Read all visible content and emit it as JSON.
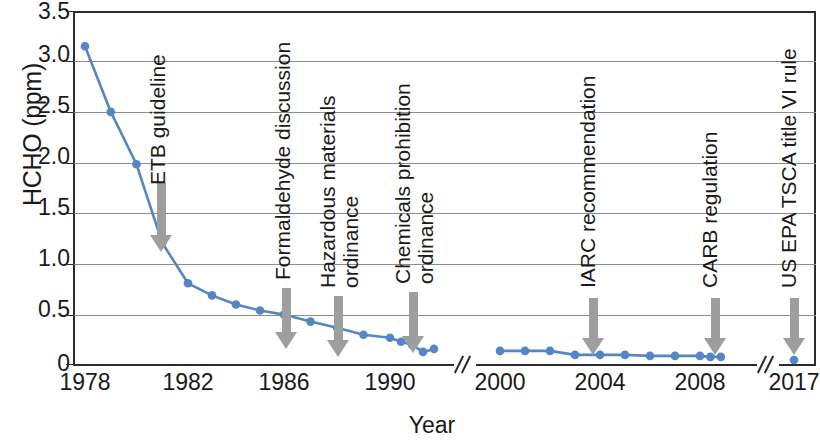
{
  "chart_data": {
    "type": "line",
    "title": "",
    "xlabel": "Year",
    "ylabel": "HCHO (ppm)",
    "ylim": [
      0,
      3.5
    ],
    "yticks": [
      "0",
      "0.5",
      "1.0",
      "1.5",
      "2.0",
      "2.5",
      "3.0",
      "3.5"
    ],
    "ytick_values": [
      0,
      0.5,
      1.0,
      1.5,
      2.0,
      2.5,
      3.0,
      3.5
    ],
    "xticks": [
      "1978",
      "1982",
      "1986",
      "1990",
      "2000",
      "2004",
      "2008",
      "2017"
    ],
    "grid": "horizontal",
    "legend": "none",
    "axis_breaks": [
      "between 1995 and 2000",
      "between 2010 and 2017"
    ],
    "line_color": "#5585c4",
    "marker_color": "#5585c4",
    "series": [
      {
        "name": "HCHO concentration",
        "x": [
          1978,
          1979,
          1980,
          1981,
          1982,
          1983,
          1984,
          1985,
          1986,
          1987,
          1988,
          1989,
          1990,
          1991,
          1992,
          1993,
          1994,
          1995
        ],
        "values": [
          3.15,
          2.5,
          1.98,
          1.2,
          0.8,
          0.68,
          0.59,
          0.53,
          0.49,
          0.42,
          0.36,
          0.29,
          0.26,
          0.22,
          0.19,
          0.12,
          0.15,
          null
        ]
      },
      {
        "name": "HCHO concentration (post-2000)",
        "x": [
          2000,
          2001,
          2002,
          2003,
          2004,
          2005,
          2006,
          2007,
          2008,
          2009,
          2010
        ],
        "values": [
          0.13,
          0.13,
          0.13,
          0.09,
          0.09,
          0.09,
          0.08,
          0.08,
          0.08,
          0.07,
          0.07
        ]
      },
      {
        "name": "HCHO concentration (2017)",
        "x": [
          2017
        ],
        "values": [
          0.04
        ]
      }
    ],
    "annotations": [
      {
        "label": "ETB guideline",
        "lines": [
          "ETB guideline"
        ],
        "year": 1981
      },
      {
        "label": "Formaldehyde discussion",
        "lines": [
          "Formaldehyde discussion"
        ],
        "year": 1986
      },
      {
        "label": "Hazardous materials ordinance",
        "lines": [
          "Hazardous materials",
          "ordinance"
        ],
        "year": 1988
      },
      {
        "label": "Chemicals prohibition ordinance",
        "lines": [
          "Chemicals prohibition",
          "ordinance"
        ],
        "year": 1991
      },
      {
        "label": "IARC recommendation",
        "lines": [
          "IARC recommendation"
        ],
        "year": 2004
      },
      {
        "label": "CARB regulation",
        "lines": [
          "CARB regulation"
        ],
        "year": 2009
      },
      {
        "label": "US EPA TSCA title VI rule",
        "lines": [
          "US EPA TSCA title VI rule"
        ],
        "year": 2017
      }
    ]
  },
  "annotation_text": {
    "a0_l1": "ETB guideline",
    "a1_l1": "Formaldehyde discussion",
    "a2_l1": "Hazardous materials",
    "a2_l2": "ordinance",
    "a3_l1": "Chemicals prohibition",
    "a3_l2": "ordinance",
    "a4_l1": "IARC recommendation",
    "a5_l1": "CARB regulation",
    "a6_l1": "US EPA TSCA title VI rule"
  }
}
